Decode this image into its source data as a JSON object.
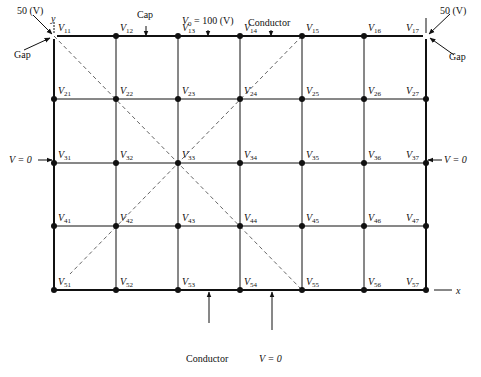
{
  "figure": {
    "grid": {
      "columns_x": [
        54,
        116,
        178,
        240,
        302,
        364,
        426
      ],
      "rows_y": [
        36,
        99,
        163,
        226,
        290
      ],
      "nodes": [
        [
          "11",
          "12",
          "13",
          "14",
          "15",
          "16",
          "17"
        ],
        [
          "21",
          "22",
          "23",
          "24",
          "25",
          "26",
          "27"
        ],
        [
          "31",
          "32",
          "33",
          "34",
          "35",
          "36",
          "37"
        ],
        [
          "41",
          "42",
          "43",
          "44",
          "45",
          "46",
          "47"
        ],
        [
          "51",
          "52",
          "53",
          "54",
          "55",
          "56",
          "57"
        ]
      ],
      "node_prefix": "V"
    },
    "labels": {
      "top_left_voltage": "50 (V)",
      "top_right_voltage": "50 (V)",
      "gap_left": "Gap",
      "gap_right": "Gap",
      "cap": "Cap",
      "v0_symbol": "V",
      "v0_sub": "0",
      "v0_value": " = 100 (V)",
      "conductor_top": "Conductor",
      "conductor_bottom": "Conductor",
      "left_boundary": "V = 0",
      "right_boundary": "V = 0",
      "bottom_boundary": "V = 0",
      "y_axis": "y",
      "x_axis": "x"
    },
    "colors": {
      "line": "#111111",
      "dashed": "#555555",
      "background": "#ffffff"
    }
  }
}
